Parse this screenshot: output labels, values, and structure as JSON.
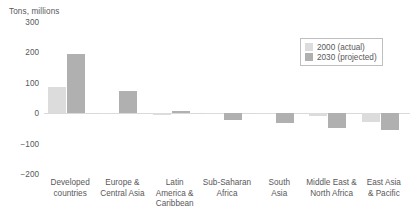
{
  "chart_data": {
    "type": "bar",
    "title": "",
    "ylabel": "Tons, millions",
    "xlabel": "",
    "ylim": [
      -200,
      300
    ],
    "yticks": [
      300,
      200,
      100,
      0,
      -100,
      -200
    ],
    "ytick_labels": [
      "300",
      "200",
      "100",
      "0",
      "−100",
      "−200"
    ],
    "grid": false,
    "legend_position": "top-right",
    "categories": [
      "Developed\ncountries",
      "Europe &\nCentral Asia",
      "Latin\nAmerica &\nCaribbean",
      "Sub-Saharan\nAfrica",
      "South\nAsia",
      "Middle East &\nNorth Africa",
      "East Asia\n& Pacific"
    ],
    "series": [
      {
        "name": "2000 (actual)",
        "color": "#dcdcdc",
        "values": [
          85,
          2,
          -6,
          -4,
          -2,
          -10,
          -30
        ]
      },
      {
        "name": "2030 (projected)",
        "color": "#b0b0b0",
        "values": [
          195,
          73,
          8,
          -22,
          -32,
          -48,
          -55
        ]
      }
    ],
    "legend": [
      {
        "label": "2000 (actual)",
        "color": "#dcdcdc"
      },
      {
        "label": "2030 (projected)",
        "color": "#b0b0b0"
      }
    ]
  }
}
